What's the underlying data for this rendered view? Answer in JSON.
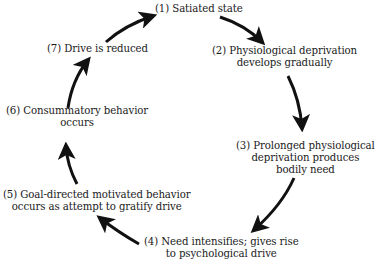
{
  "diagram": {
    "type": "cycle",
    "title": "",
    "nodes": [
      {
        "id": 1,
        "line1": "(1) Satiated state",
        "line2": "",
        "line3": ""
      },
      {
        "id": 2,
        "line1": "(2) Physiological deprivation",
        "line2": "develops gradually",
        "line3": ""
      },
      {
        "id": 3,
        "line1": "(3) Prolonged physiological",
        "line2": "deprivation produces",
        "line3": "bodily need"
      },
      {
        "id": 4,
        "line1": "(4) Need intensifies; gives rise",
        "line2": "to psychological drive",
        "line3": ""
      },
      {
        "id": 5,
        "line1": "(5) Goal-directed motivated behavior",
        "line2": "occurs as attempt to gratify drive",
        "line3": ""
      },
      {
        "id": 6,
        "line1": "(6) Consummatory behavior",
        "line2": "occurs",
        "line3": ""
      },
      {
        "id": 7,
        "line1": "(7) Drive is reduced",
        "line2": "",
        "line3": ""
      }
    ],
    "edges": [
      {
        "from": 1,
        "to": 2
      },
      {
        "from": 2,
        "to": 3
      },
      {
        "from": 3,
        "to": 4
      },
      {
        "from": 4,
        "to": 5
      },
      {
        "from": 5,
        "to": 6
      },
      {
        "from": 6,
        "to": 7
      },
      {
        "from": 7,
        "to": 1
      }
    ],
    "colors": {
      "text": "#1a1a1a",
      "arrow": "#111111",
      "background": "#ffffff"
    }
  }
}
